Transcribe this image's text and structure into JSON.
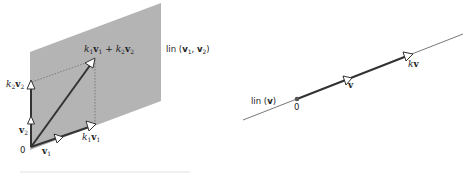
{
  "left_figure": {
    "plane_label": "lin (v₁, v₂)",
    "plane_label_parts": {
      "prefix": "lin (",
      "v1": "v",
      "s1": "1",
      "sep": ", ",
      "v2": "v",
      "s2": "2",
      "suffix": ")"
    },
    "sum_label": {
      "k1": "k",
      "k1s": "1",
      "v1": "v",
      "v1s": "1",
      "plus": " + ",
      "k2": "k",
      "k2s": "2",
      "v2": "v",
      "v2s": "2"
    },
    "k2v2_label": {
      "k": "k",
      "ks": "2",
      "v": "v",
      "vs": "2"
    },
    "k1v1_label": {
      "k": "k",
      "ks": "1",
      "v": "v",
      "vs": "1"
    },
    "v1_label": {
      "v": "v",
      "s": "1"
    },
    "v2_label": {
      "v": "v",
      "s": "2"
    },
    "origin_label": "0",
    "colors": {
      "plane": "#b4b4b4",
      "vector": "#333333",
      "dashed": "#555555"
    }
  },
  "right_figure": {
    "line_label": "lin (v)",
    "line_label_parts": {
      "prefix": "lin (",
      "v": "v",
      "suffix": ")"
    },
    "v_label": "v",
    "kv_label": {
      "k": "k",
      "v": "v"
    },
    "origin_label": "0",
    "colors": {
      "line": "#444444",
      "vector": "#333333",
      "origin_dot": "#555555"
    }
  }
}
